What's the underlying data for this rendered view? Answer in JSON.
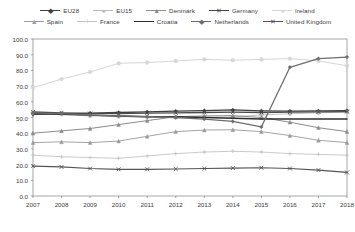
{
  "chart_data": {
    "type": "line",
    "title": "",
    "xlabel": "",
    "ylabel": "",
    "categories": [
      "2007",
      "2008",
      "2009",
      "2010",
      "2011",
      "2012",
      "2013",
      "2014",
      "2015",
      "2016",
      "2017",
      "2018"
    ],
    "ylim": [
      0,
      100
    ],
    "ytick_step": 10,
    "yticks": [
      "0.0",
      "10.0",
      "20.0",
      "30.0",
      "40.0",
      "50.0",
      "60.0",
      "70.0",
      "80.0",
      "90.0",
      "100.0"
    ],
    "grid": false,
    "legend_position": "top",
    "series": [
      {
        "name": "EU28",
        "color": "#3f3f3f",
        "marker": "diamond",
        "width": 1.3,
        "values": [
          52.0,
          52.5,
          52.8,
          53.2,
          53.6,
          54.0,
          54.4,
          54.8,
          54.2,
          54.0,
          54.2,
          54.4
        ]
      },
      {
        "name": "EU15",
        "color": "#b9b9b9",
        "marker": "circle",
        "width": 0.9,
        "values": [
          53.0,
          52.0,
          51.0,
          50.6,
          50.4,
          50.2,
          50.0,
          50.4,
          51.6,
          52.4,
          53.0,
          53.4
        ]
      },
      {
        "name": "Denmark",
        "color": "#8c8c8c",
        "marker": "triangle",
        "width": 1.0,
        "values": [
          40.0,
          41.5,
          43.0,
          45.5,
          48.0,
          50.5,
          51.0,
          51.2,
          50.0,
          47.0,
          43.5,
          41.0
        ]
      },
      {
        "name": "Germany",
        "color": "#4a4a4a",
        "marker": "cross",
        "width": 1.3,
        "values": [
          53.5,
          53.0,
          52.5,
          52.5,
          52.8,
          53.0,
          53.2,
          53.4,
          53.2,
          53.4,
          53.6,
          53.8
        ]
      },
      {
        "name": "Ireland",
        "color": "#d6d6d6",
        "marker": "circle",
        "width": 1.0,
        "values": [
          69.0,
          74.5,
          79.0,
          84.5,
          85.0,
          86.0,
          87.0,
          86.5,
          87.0,
          87.5,
          86.0,
          83.0
        ]
      },
      {
        "name": "Spain",
        "color": "#9a9a9a",
        "marker": "triangle",
        "width": 0.9,
        "values": [
          34.0,
          34.5,
          34.0,
          35.0,
          38.0,
          41.0,
          42.0,
          42.2,
          41.0,
          38.5,
          35.5,
          34.0
        ]
      },
      {
        "name": "France",
        "color": "#c4c4c4",
        "marker": "plus",
        "width": 0.9,
        "values": [
          26.0,
          25.0,
          24.5,
          24.0,
          25.5,
          27.0,
          28.0,
          28.5,
          28.0,
          27.0,
          26.5,
          26.0
        ]
      },
      {
        "name": "Croatia",
        "color": "#2e2e2e",
        "marker": "none",
        "width": 1.4,
        "values": [
          52.5,
          52.0,
          51.5,
          51.0,
          50.5,
          50.5,
          50.0,
          49.5,
          49.0,
          49.0,
          49.0,
          49.0
        ]
      },
      {
        "name": "Netherlands",
        "color": "#6e6e6e",
        "marker": "diamond",
        "width": 1.3,
        "values": [
          53.0,
          52.5,
          51.5,
          51.0,
          50.5,
          50.0,
          49.0,
          47.5,
          44.0,
          82.0,
          87.5,
          88.5
        ]
      },
      {
        "name": "United Kingdom",
        "color": "#555555",
        "marker": "cross",
        "width": 1.2,
        "values": [
          19.0,
          18.5,
          17.5,
          17.0,
          17.0,
          17.2,
          17.5,
          17.8,
          18.0,
          17.5,
          16.5,
          15.0
        ]
      }
    ]
  },
  "legend": {
    "rows": [
      [
        "EU28",
        "EU15",
        "Denmark",
        "Germany",
        "Ireland"
      ],
      [
        "Spain",
        "France",
        "Croatia",
        "Netherlands",
        "United Kingdom"
      ]
    ]
  },
  "axis": {
    "frame_color": "#808080"
  }
}
